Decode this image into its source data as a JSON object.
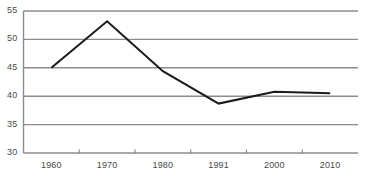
{
  "chart_data": {
    "type": "line",
    "title": "",
    "subtitle": "",
    "xlabel": "",
    "ylabel": "",
    "categories": [
      "1960",
      "1970",
      "1980",
      "1991",
      "2000",
      "2010"
    ],
    "x": [
      1960,
      1970,
      1980,
      1991,
      2000,
      2010
    ],
    "values": [
      45.0,
      53.2,
      44.4,
      38.7,
      40.8,
      40.5
    ],
    "series": [
      {
        "name": "",
        "values": [
          45.0,
          53.2,
          44.4,
          38.7,
          40.8,
          40.5
        ]
      }
    ],
    "ylim": [
      30,
      55
    ],
    "yticks": [
      30,
      35,
      40,
      45,
      50,
      55
    ],
    "ytick_labels": [
      "30",
      "35",
      "40",
      "45",
      "50",
      "55"
    ],
    "xtick_labels": [
      "1960",
      "1970",
      "1980",
      "1991",
      "2000",
      "2010"
    ],
    "grid": true,
    "grid_axis": "y",
    "legend": false,
    "legend_position": "none",
    "annotations": [],
    "colors": {
      "line": "#1a1a1a",
      "grid": "#8c8c8c",
      "axis": "#8c8c8c",
      "tick_label": "#4a4a4a",
      "background": "#ffffff"
    }
  }
}
